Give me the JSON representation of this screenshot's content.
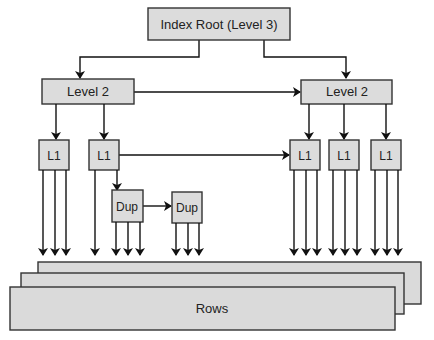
{
  "diagram": {
    "root": {
      "label": "Index Root (Level 3)"
    },
    "level2": [
      {
        "label": "Level 2"
      },
      {
        "label": "Level 2"
      }
    ],
    "level1": [
      {
        "label": "L1"
      },
      {
        "label": "L1"
      },
      {
        "label": "L1"
      },
      {
        "label": "L1"
      },
      {
        "label": "L1"
      }
    ],
    "dup": [
      {
        "label": "Dup"
      },
      {
        "label": "Dup"
      }
    ],
    "rows": {
      "label": "Rows",
      "sheet_count": 3
    },
    "colors": {
      "box_fill": "#dcdcdc",
      "stroke": "#333333",
      "arrow": "#111111",
      "background": "#ffffff"
    }
  }
}
